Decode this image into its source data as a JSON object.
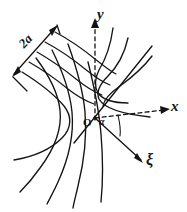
{
  "figure": {
    "background_color": "#ffffff",
    "ink_color": "#141414",
    "width": 187,
    "height": 212,
    "labels": {
      "y_axis": "y",
      "x_axis": "x",
      "xi_axis": "ξ",
      "origin": "O",
      "angle": "α",
      "dimension": "2a"
    },
    "axes": [
      {
        "name": "y-axis",
        "label": "y",
        "style": "dashed",
        "direction": "up",
        "arrow": true,
        "from": [
          95,
          118
        ],
        "to": [
          95,
          22
        ]
      },
      {
        "name": "x-axis",
        "label": "x",
        "style": "dashed",
        "direction": "right",
        "arrow": true,
        "from": [
          95,
          118
        ],
        "to": [
          168,
          108
        ]
      },
      {
        "name": "xi-axis",
        "label": "ξ",
        "style": "solid",
        "direction": "down-right",
        "arrow": true,
        "from": [
          95,
          118
        ],
        "to": [
          143,
          162
        ]
      },
      {
        "name": "eta-axis",
        "label": "",
        "style": "solid",
        "direction": "up-right",
        "arrow": false,
        "from": [
          95,
          118
        ],
        "to": [
          150,
          48
        ]
      }
    ],
    "angle_marker": {
      "name": "alpha",
      "label": "α",
      "between": [
        "x-axis",
        "xi-axis"
      ],
      "vertex": [
        95,
        118
      ]
    },
    "dimension_marker": {
      "label": "2a",
      "style": "double-arrow-bracket",
      "orientation": "diagonal",
      "from": [
        14,
        73
      ],
      "to": [
        56,
        27
      ]
    },
    "curve_family": {
      "type": "confocal-hyperbolae-streamlines",
      "count": 9,
      "description": "Family of smooth curves sweeping from upper right, bending around the origin region and fanning out to the lower left and bottom"
    }
  }
}
